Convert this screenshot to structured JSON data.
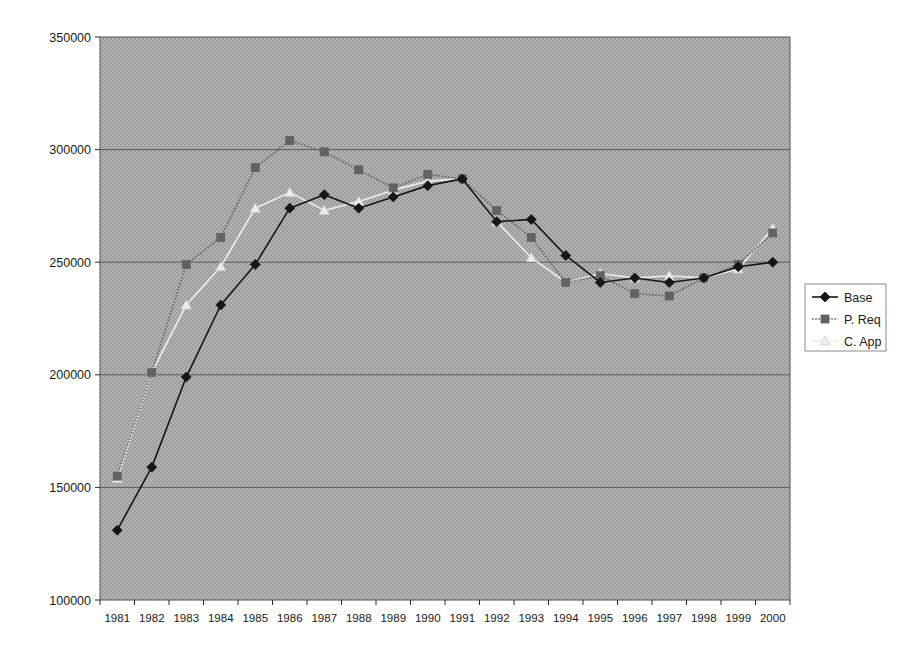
{
  "chart_data": {
    "type": "line",
    "title": "",
    "subtitle": "",
    "xlabel": "",
    "ylabel": "",
    "categories": [
      "1981",
      "1982",
      "1983",
      "1984",
      "1985",
      "1986",
      "1987",
      "1988",
      "1989",
      "1990",
      "1991",
      "1992",
      "1993",
      "1994",
      "1995",
      "1996",
      "1997",
      "1998",
      "1999",
      "2000"
    ],
    "ylim": [
      100000,
      350000
    ],
    "ytick_labels": [
      "100000",
      "150000",
      "200000",
      "250000",
      "300000",
      "350000"
    ],
    "ytick_values": [
      100000,
      150000,
      200000,
      250000,
      300000,
      350000
    ],
    "grid": "horizontal",
    "legend_position": "right",
    "plot_background": "#a9a9a9",
    "series": [
      {
        "name": "Base",
        "color": "#161616",
        "marker": "diamond",
        "line_style": "solid",
        "values": [
          131000,
          159000,
          199000,
          231000,
          249000,
          274000,
          280000,
          274000,
          279000,
          284000,
          287000,
          268000,
          269000,
          253000,
          241000,
          243000,
          241000,
          243000,
          248000,
          250000
        ]
      },
      {
        "name": "P. Req",
        "color": "#626262",
        "marker": "square",
        "line_style": "dotted",
        "values": [
          155000,
          201000,
          249000,
          261000,
          292000,
          304000,
          299000,
          291000,
          283000,
          289000,
          287000,
          273000,
          261000,
          241000,
          244000,
          236000,
          235000,
          243000,
          249000,
          263000
        ]
      },
      {
        "name": "C. App",
        "color": "#ededed",
        "marker": "triangle",
        "line_style": "solid",
        "values": [
          154000,
          201000,
          231000,
          248000,
          274000,
          281000,
          273000,
          277000,
          282000,
          286000,
          287000,
          268000,
          252000,
          241000,
          245000,
          243000,
          244000,
          243000,
          247000,
          265000
        ]
      }
    ]
  },
  "legend": {
    "entries": [
      {
        "label": "Base"
      },
      {
        "label": "P. Req"
      },
      {
        "label": "C. App"
      }
    ]
  }
}
